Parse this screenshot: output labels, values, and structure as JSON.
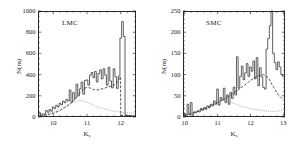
{
  "figure": {
    "background": "#ffffff",
    "axis_color": "#2b2b2b"
  },
  "chart_data": [
    {
      "type": "line",
      "panel_id": "lmc",
      "title": "LMC",
      "xlabel": "K_s",
      "ylabel": "N(m)",
      "xlim": [
        9.55,
        12.45
      ],
      "ylim": [
        0,
        1000
      ],
      "xticks": [
        10,
        11,
        12
      ],
      "xticklabels": [
        "10",
        "11",
        "12"
      ],
      "yticks": [
        0,
        200,
        400,
        600,
        800,
        1000
      ],
      "yticklabels": [
        "0",
        "200",
        "400",
        "600",
        "800",
        "1000"
      ],
      "minor_xticks_per_major": 5,
      "minor_yticks_per_major": 4,
      "grid": false,
      "legend": "none",
      "series": [
        {
          "name": "observed counts",
          "style": "solid-step",
          "color": "#2b2b2b",
          "x": [
            9.6,
            9.65,
            9.7,
            9.75,
            9.8,
            9.85,
            9.9,
            9.95,
            10.0,
            10.05,
            10.1,
            10.15,
            10.2,
            10.25,
            10.3,
            10.35,
            10.4,
            10.45,
            10.5,
            10.55,
            10.6,
            10.65,
            10.7,
            10.75,
            10.8,
            10.85,
            10.9,
            10.95,
            11.0,
            11.05,
            11.1,
            11.15,
            11.2,
            11.25,
            11.3,
            11.35,
            11.4,
            11.45,
            11.5,
            11.55,
            11.6,
            11.65,
            11.7,
            11.75,
            11.8,
            11.85,
            11.9,
            11.95,
            12.0,
            12.05,
            12.1,
            12.15,
            12.2,
            12.25,
            12.3,
            12.35,
            12.4
          ],
          "values": [
            40,
            15,
            30,
            25,
            60,
            45,
            70,
            55,
            95,
            80,
            110,
            95,
            130,
            115,
            150,
            135,
            165,
            150,
            255,
            140,
            230,
            175,
            310,
            200,
            265,
            330,
            215,
            345,
            350,
            300,
            395,
            420,
            370,
            430,
            330,
            410,
            445,
            360,
            455,
            395,
            300,
            470,
            340,
            275,
            455,
            380,
            270,
            385,
            745,
            900,
            760,
            20,
            15,
            10,
            12,
            8,
            10
          ]
        },
        {
          "name": "model fit (dashed)",
          "style": "dashed",
          "color": "#2b2b2b",
          "x": [
            9.6,
            9.8,
            10.0,
            10.2,
            10.4,
            10.55,
            10.7,
            10.8,
            10.9,
            11.0,
            11.05,
            11.1,
            11.2,
            11.3,
            11.4,
            11.5,
            11.6,
            11.7,
            11.8,
            11.9,
            11.99,
            12.0,
            12.2,
            12.4
          ],
          "values": [
            10,
            20,
            35,
            60,
            100,
            135,
            190,
            230,
            265,
            280,
            278,
            272,
            258,
            255,
            262,
            270,
            280,
            290,
            300,
            330,
            380,
            15,
            12,
            10
          ]
        },
        {
          "name": "background component (dotted)",
          "style": "dotted",
          "color": "#6a6a6a",
          "x": [
            9.6,
            9.8,
            10.0,
            10.2,
            10.4,
            10.55,
            10.7,
            10.8,
            10.9,
            11.0,
            11.1,
            11.2,
            11.35,
            11.5,
            11.65,
            11.8,
            11.95,
            12.1,
            12.25,
            12.4
          ],
          "values": [
            12,
            25,
            45,
            75,
            110,
            135,
            152,
            155,
            150,
            140,
            125,
            110,
            92,
            78,
            65,
            55,
            48,
            42,
            38,
            35
          ]
        }
      ]
    },
    {
      "type": "line",
      "panel_id": "smc",
      "title": "SMC",
      "xlabel": "K_s",
      "ylabel": "N(m)",
      "xlim": [
        9.95,
        13.05
      ],
      "ylim": [
        0,
        250
      ],
      "xticks": [
        10,
        11,
        12,
        13
      ],
      "xticklabels": [
        "10",
        "11",
        "12",
        "13"
      ],
      "yticks": [
        0,
        50,
        100,
        150,
        200,
        250
      ],
      "yticklabels": [
        "0",
        "50",
        "100",
        "150",
        "200",
        "250"
      ],
      "minor_xticks_per_major": 5,
      "minor_yticks_per_major": 5,
      "grid": false,
      "legend": "none",
      "series": [
        {
          "name": "observed counts",
          "style": "solid-step",
          "color": "#2b2b2b",
          "x": [
            10.0,
            10.05,
            10.1,
            10.15,
            10.2,
            10.25,
            10.3,
            10.35,
            10.4,
            10.45,
            10.5,
            10.55,
            10.6,
            10.65,
            10.7,
            10.75,
            10.8,
            10.85,
            10.9,
            10.95,
            11.0,
            11.05,
            11.1,
            11.15,
            11.2,
            11.25,
            11.3,
            11.35,
            11.4,
            11.45,
            11.5,
            11.55,
            11.6,
            11.65,
            11.7,
            11.75,
            11.8,
            11.85,
            11.9,
            11.95,
            12.0,
            12.05,
            12.1,
            12.15,
            12.2,
            12.25,
            12.3,
            12.35,
            12.4,
            12.45,
            12.5,
            12.55,
            12.6,
            12.65,
            12.7,
            12.75,
            12.8,
            12.85,
            12.9,
            12.95,
            13.0
          ],
          "values": [
            8,
            2,
            30,
            5,
            34,
            4,
            12,
            10,
            14,
            12,
            20,
            16,
            22,
            18,
            26,
            22,
            30,
            26,
            38,
            30,
            66,
            28,
            46,
            40,
            68,
            34,
            52,
            30,
            58,
            44,
            70,
            52,
            142,
            68,
            96,
            120,
            88,
            104,
            126,
            96,
            118,
            108,
            132,
            90,
            140,
            74,
            116,
            95,
            70,
            66,
            160,
            185,
            215,
            250,
            150,
            128,
            112,
            130,
            118,
            100,
            96
          ]
        },
        {
          "name": "model fit (dashed)",
          "style": "dashed",
          "color": "#2b2b2b",
          "x": [
            10.0,
            10.2,
            10.4,
            10.6,
            10.8,
            11.0,
            11.2,
            11.4,
            11.6,
            11.8,
            12.0,
            12.2,
            12.4,
            12.55,
            12.7,
            12.85,
            13.0
          ],
          "values": [
            4,
            8,
            14,
            20,
            26,
            34,
            42,
            52,
            62,
            74,
            86,
            96,
            100,
            92,
            70,
            52,
            40
          ]
        },
        {
          "name": "background component (dotted)",
          "style": "dotted",
          "color": "#6a6a6a",
          "x": [
            10.0,
            10.2,
            10.4,
            10.6,
            10.8,
            11.0,
            11.15,
            11.3,
            11.5,
            11.7,
            11.9,
            12.1,
            12.3,
            12.5,
            12.7,
            12.85,
            13.0
          ],
          "values": [
            5,
            9,
            14,
            20,
            28,
            36,
            40,
            38,
            32,
            26,
            22,
            18,
            16,
            14,
            13,
            14,
            16
          ]
        }
      ]
    }
  ]
}
